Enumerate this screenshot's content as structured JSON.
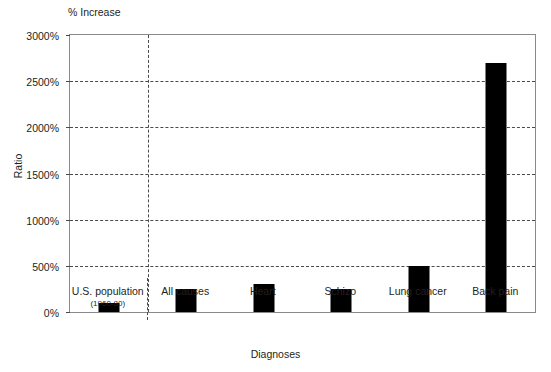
{
  "chart_data": {
    "type": "bar",
    "title": "% Increase",
    "xlabel": "Diagnoses",
    "ylabel": "Ratio",
    "ylim": [
      0,
      3000
    ],
    "ytick_step": 500,
    "ytick_labels": [
      "0%",
      "500%",
      "1000%",
      "1500%",
      "2000%",
      "2500%",
      "3000%"
    ],
    "ytick_values": [
      0,
      500,
      1000,
      1500,
      2000,
      2500,
      3000
    ],
    "grid": "horizontal-dashed",
    "legend": "none",
    "bar_color": "#000000",
    "categories": [
      "U.S. population",
      "All causes",
      "Heart",
      "Schizo",
      "Lung cancer",
      "Back pain"
    ],
    "category_sublabels": [
      "(1960-80)",
      "",
      "",
      "",
      "",
      ""
    ],
    "values": [
      100,
      250,
      300,
      250,
      500,
      2700
    ],
    "separator_after_index": 0,
    "separator_style": "vertical-dashed"
  }
}
